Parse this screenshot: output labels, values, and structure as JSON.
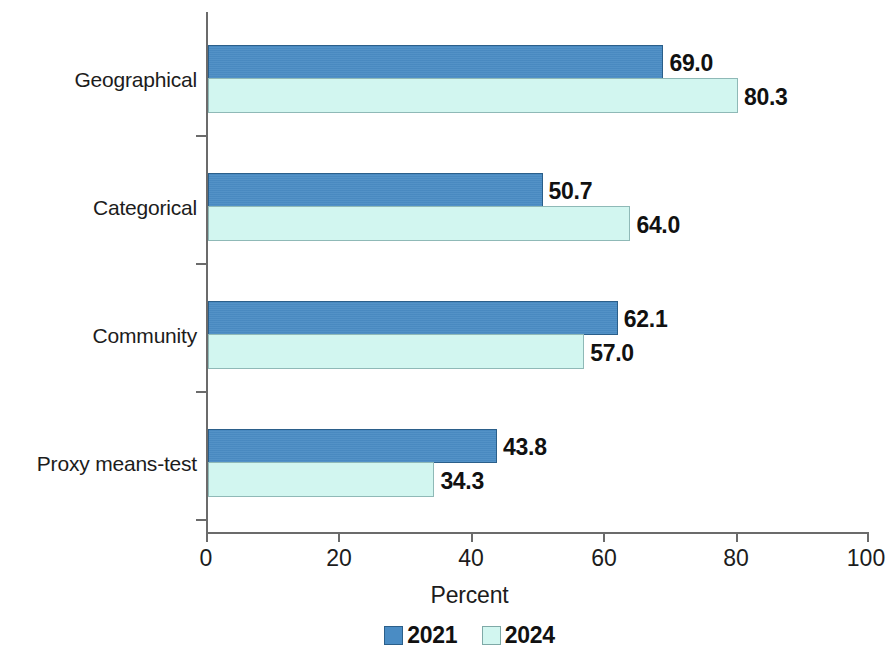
{
  "chart_data": {
    "type": "bar",
    "orientation": "horizontal",
    "title": "",
    "subtitle": "",
    "xlabel": "Percent",
    "ylabel": "",
    "xlim": [
      0,
      100
    ],
    "xticks": [
      0,
      20,
      40,
      60,
      80,
      100
    ],
    "xtick_labels": [
      "0",
      "20",
      "40",
      "60",
      "80",
      "100"
    ],
    "grid": false,
    "legend_position": "bottom",
    "categories": [
      "Geographical",
      "Categorical",
      "Community",
      "Proxy means-test"
    ],
    "series": [
      {
        "name": "2021",
        "color": "#4a8cc4",
        "values": [
          69.0,
          50.7,
          62.1,
          43.8
        ],
        "value_labels": [
          "69.0",
          "50.7",
          "62.1",
          "43.8"
        ]
      },
      {
        "name": "2024",
        "color": "#d2f6f0",
        "values": [
          80.3,
          64.0,
          57.0,
          34.3
        ],
        "value_labels": [
          "80.3",
          "64.0",
          "57.0",
          "34.3"
        ]
      }
    ]
  },
  "axis": {
    "x_title": "Percent",
    "tick_labels": [
      "0",
      "20",
      "40",
      "60",
      "80",
      "100"
    ]
  },
  "legend": {
    "items": [
      {
        "label": "2021",
        "color": "#4a8cc4"
      },
      {
        "label": "2024",
        "color": "#d2f6f0"
      }
    ]
  },
  "colors": {
    "series_2021": "#4a8cc4",
    "series_2021_border": "#2b5f8a",
    "series_2024": "#d2f6f0",
    "series_2024_border": "#8fb9b7",
    "axis": "#6b6b6b",
    "text": "#1c1c1c",
    "background": "#ffffff"
  }
}
